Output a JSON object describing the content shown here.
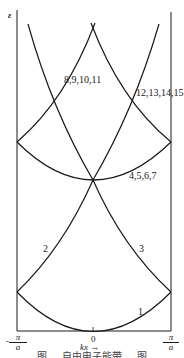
{
  "diagram": {
    "y_axis_label": "ε",
    "x_axis_label": "kx →",
    "x_ticks": {
      "left": {
        "sign": "-",
        "num": "π",
        "den": "a"
      },
      "center": "0",
      "right": {
        "num": "π",
        "den": "a"
      }
    },
    "band_labels": {
      "b1": "1",
      "b2": "2",
      "b3": "3",
      "b4": "4,5,6,7",
      "b8": "8,9,10,11",
      "b12": "12,13,14,15"
    },
    "caption": "图 … 自由电子能带 … 图"
  }
}
